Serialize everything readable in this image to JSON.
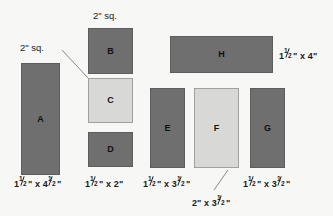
{
  "diagram": {
    "background_color": "#f7f7f5",
    "colors": {
      "dark_piece": "#6f6f6f",
      "light_piece": "#d8d8d6",
      "text": "#1a1a1a",
      "leader_line": "#8a8a8a"
    }
  },
  "pieces": [
    {
      "id": "A",
      "label": "A",
      "shade": "dark",
      "x": 21,
      "y": 63,
      "w": 39,
      "h": 112,
      "dimension": "1½\" x 4½\"",
      "dim_parts": {
        "w_whole": "1",
        "w_num": "1",
        "w_den": "2",
        "h_whole": "4",
        "h_num": "1",
        "h_den": "2"
      }
    },
    {
      "id": "B",
      "label": "B",
      "shade": "dark",
      "x": 88,
      "y": 28,
      "w": 45,
      "h": 46,
      "dimension": "2\" sq.",
      "dim_parts": {}
    },
    {
      "id": "C",
      "label": "C",
      "shade": "light",
      "x": 88,
      "y": 78,
      "w": 45,
      "h": 45,
      "dimension": "2\" sq.",
      "dim_parts": {}
    },
    {
      "id": "D",
      "label": "D",
      "shade": "dark",
      "x": 88,
      "y": 132,
      "w": 45,
      "h": 35,
      "dimension": "1½\" x 2\"",
      "dim_parts": {
        "w_whole": "1",
        "w_num": "1",
        "w_den": "2",
        "h_whole": "2"
      }
    },
    {
      "id": "E",
      "label": "E",
      "shade": "dark",
      "x": 150,
      "y": 88,
      "w": 35,
      "h": 80,
      "dimension": "1½\" x 3½\"",
      "dim_parts": {
        "w_whole": "1",
        "w_num": "1",
        "w_den": "2",
        "h_whole": "3",
        "h_num": "1",
        "h_den": "2"
      }
    },
    {
      "id": "F",
      "label": "F",
      "shade": "light",
      "x": 194,
      "y": 88,
      "w": 45,
      "h": 80,
      "dimension": "2\" x 3½\"",
      "dim_parts": {
        "w_whole": "2",
        "h_whole": "3",
        "h_num": "1",
        "h_den": "2"
      }
    },
    {
      "id": "G",
      "label": "G",
      "shade": "dark",
      "x": 250,
      "y": 88,
      "w": 35,
      "h": 80,
      "dimension": "1½\" x 3½\"",
      "dim_parts": {
        "w_whole": "1",
        "w_num": "1",
        "w_den": "2",
        "h_whole": "3",
        "h_num": "1",
        "h_den": "2"
      }
    },
    {
      "id": "H",
      "label": "H",
      "shade": "dark",
      "x": 170,
      "y": 36,
      "w": 103,
      "h": 37,
      "dimension": "1½\" x 4\"",
      "dim_parts": {
        "w_whole": "1",
        "w_num": "1",
        "w_den": "2",
        "h_whole": "4"
      }
    }
  ],
  "callouts": [
    {
      "id": "b-square",
      "text": "2\" sq.",
      "x": 93,
      "y": 11
    },
    {
      "id": "c-square",
      "text": "2\" sq.",
      "x": 20,
      "y": 43
    }
  ],
  "dimension_labels": [
    {
      "for": "A",
      "text": "1½\" x 4½\"",
      "x": 14,
      "y": 178
    },
    {
      "for": "D",
      "text": "1½\" x 2\"",
      "x": 85,
      "y": 178
    },
    {
      "for": "E",
      "text": "1½\" x 3½\"",
      "x": 143,
      "y": 178
    },
    {
      "for": "G",
      "text": "1½\" x 3½\"",
      "x": 243,
      "y": 178
    },
    {
      "for": "H",
      "text": "1½\" x 4\"",
      "x": 279,
      "y": 50
    },
    {
      "for": "F",
      "text": "2\" x 3½\"",
      "x": 192,
      "y": 197
    }
  ],
  "leader_lines": [
    {
      "from": "c-square-callout",
      "to": "C-top-left",
      "x1": 62,
      "y1": 50,
      "x2": 88,
      "y2": 78
    },
    {
      "from": "F-dimension",
      "to": "F-bottom",
      "x1": 215,
      "y1": 188,
      "x2": 227,
      "y2": 170
    }
  ]
}
